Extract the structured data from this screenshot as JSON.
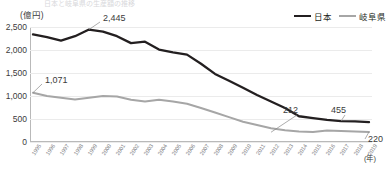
{
  "title_faint": "日本と岐阜県の生産額の推移",
  "axis": {
    "y_unit": "(億円)",
    "x_unit": "(年)",
    "y_ticks": [
      "2,500",
      "2,000",
      "1,500",
      "1,000",
      "500",
      "0"
    ]
  },
  "legend": [
    {
      "label": "日本",
      "color": "#231f20",
      "icon": "line-swatch-icon"
    },
    {
      "label": "岐阜県",
      "color": "#a6a6a6",
      "icon": "line-swatch-icon"
    }
  ],
  "annotations": [
    {
      "name": "annotation-2445",
      "text": "2,445"
    },
    {
      "name": "annotation-1071",
      "text": "1,071"
    },
    {
      "name": "annotation-212",
      "text": "212"
    },
    {
      "name": "annotation-455",
      "text": "455"
    },
    {
      "name": "annotation-220",
      "text": "220"
    }
  ],
  "chart_data": {
    "type": "line",
    "title": "日本と岐阜県の生産額の推移",
    "xlabel": "(年)",
    "ylabel": "(億円)",
    "ylim": [
      0,
      2500
    ],
    "yticks": [
      0,
      500,
      1000,
      1500,
      2000,
      2500
    ],
    "grid": true,
    "legend_position": "top-right",
    "categories": [
      "1995",
      "1996",
      "1997",
      "1998",
      "1999",
      "2000",
      "2001",
      "2002",
      "2003",
      "2004",
      "2005",
      "2006",
      "2007",
      "2008",
      "2009",
      "2010",
      "2011",
      "2012",
      "2013",
      "2014",
      "2015",
      "2016",
      "2017",
      "2018",
      "2019"
    ],
    "series": [
      {
        "name": "日本",
        "color": "#231f20",
        "values": [
          2340,
          2280,
          2205,
          2300,
          2445,
          2400,
          2300,
          2150,
          2180,
          2010,
          1950,
          1900,
          1700,
          1480,
          1330,
          1180,
          1020,
          880,
          740,
          560,
          520,
          480,
          455,
          450,
          430
        ]
      },
      {
        "name": "岐阜県",
        "color": "#a6a6a6",
        "values": [
          1071,
          1000,
          960,
          925,
          960,
          1000,
          990,
          920,
          880,
          920,
          880,
          830,
          740,
          640,
          540,
          440,
          370,
          300,
          255,
          230,
          220,
          250,
          240,
          230,
          220
        ]
      }
    ],
    "point_labels": [
      {
        "series": "日本",
        "category": "1999",
        "value": 2445,
        "text": "2,445"
      },
      {
        "series": "日本",
        "category": "2017",
        "value": 455,
        "text": "455"
      },
      {
        "series": "岐阜県",
        "category": "1995",
        "value": 1071,
        "text": "1,071"
      },
      {
        "series": "岐阜県",
        "category": "2012",
        "value": 212,
        "text": "212"
      },
      {
        "series": "岐阜県",
        "category": "2019",
        "value": 220,
        "text": "220"
      }
    ]
  }
}
